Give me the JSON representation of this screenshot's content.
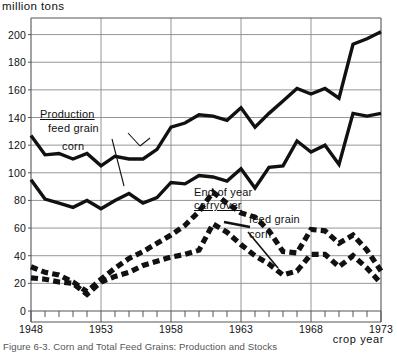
{
  "figure": {
    "unit_label": "million tons",
    "caption": "Figure 6-3.  Corn and Total Feed Grains: Production and Stocks",
    "x_axis_title": "crop year"
  },
  "annotations": {
    "production_title": "Production",
    "production_feed_grain": "feed grain",
    "production_corn": "corn",
    "carryover_title_line1": "End of year",
    "carryover_title_line2": "carryover",
    "carryover_feed_grain": "feed grain",
    "carryover_corn": "corn"
  },
  "colors": {
    "ink": "#111111",
    "grid": "#8a8a8a",
    "axis": "#555555",
    "background": "#ffffff"
  },
  "chart_data": {
    "type": "line",
    "title": "Corn and Total Feed Grains: Production and Stocks",
    "xlabel": "crop year",
    "ylabel": "million tons",
    "xlim": [
      1948,
      1973
    ],
    "ylim": [
      0,
      212
    ],
    "grid": true,
    "y_ticks": [
      0,
      20,
      40,
      60,
      80,
      100,
      120,
      140,
      160,
      180,
      200
    ],
    "x_ticks": [
      1948,
      1949,
      1950,
      1951,
      1952,
      1953,
      1954,
      1955,
      1956,
      1957,
      1958,
      1959,
      1960,
      1961,
      1962,
      1963,
      1964,
      1965,
      1966,
      1967,
      1968,
      1969,
      1970,
      1971,
      1972,
      1973
    ],
    "x_tick_labels": [
      "1948",
      "1953",
      "1958",
      "1963",
      "1968",
      "1973"
    ],
    "x_labeled_years": [
      1948,
      1953,
      1958,
      1963,
      1968,
      1973
    ],
    "gridline_years": [
      1953,
      1958,
      1963,
      1968
    ],
    "legend_position": "inline-annotations",
    "x": [
      1948,
      1949,
      1950,
      1951,
      1952,
      1953,
      1954,
      1955,
      1956,
      1957,
      1958,
      1959,
      1960,
      1961,
      1962,
      1963,
      1964,
      1965,
      1966,
      1967,
      1968,
      1969,
      1970,
      1971,
      1972,
      1973
    ],
    "series": [
      {
        "name": "Production feed grain",
        "style": "solid",
        "values": [
          127,
          113,
          114,
          110,
          114,
          105,
          112,
          110,
          110,
          117,
          133,
          136,
          142,
          141,
          138,
          147,
          133,
          143,
          152,
          161,
          157,
          161,
          154,
          193,
          197,
          202
        ]
      },
      {
        "name": "Production corn",
        "style": "solid",
        "values": [
          95,
          81,
          78,
          75,
          80,
          74,
          80,
          85,
          78,
          82,
          93,
          92,
          98,
          97,
          94,
          103,
          89,
          104,
          105,
          123,
          115,
          120,
          106,
          143,
          141,
          143
        ]
      },
      {
        "name": "End of year carryover feed grain",
        "style": "dashed",
        "values": [
          32,
          28,
          26,
          21,
          14,
          23,
          31,
          38,
          43,
          49,
          55,
          62,
          72,
          86,
          78,
          71,
          68,
          58,
          43,
          42,
          59,
          58,
          49,
          55,
          44,
          29
        ]
      },
      {
        "name": "End of year carryover corn",
        "style": "dashed",
        "values": [
          24,
          23,
          21,
          20,
          12,
          21,
          25,
          28,
          33,
          36,
          39,
          41,
          44,
          63,
          57,
          48,
          40,
          34,
          26,
          29,
          41,
          41,
          32,
          40,
          31,
          20
        ]
      }
    ]
  }
}
